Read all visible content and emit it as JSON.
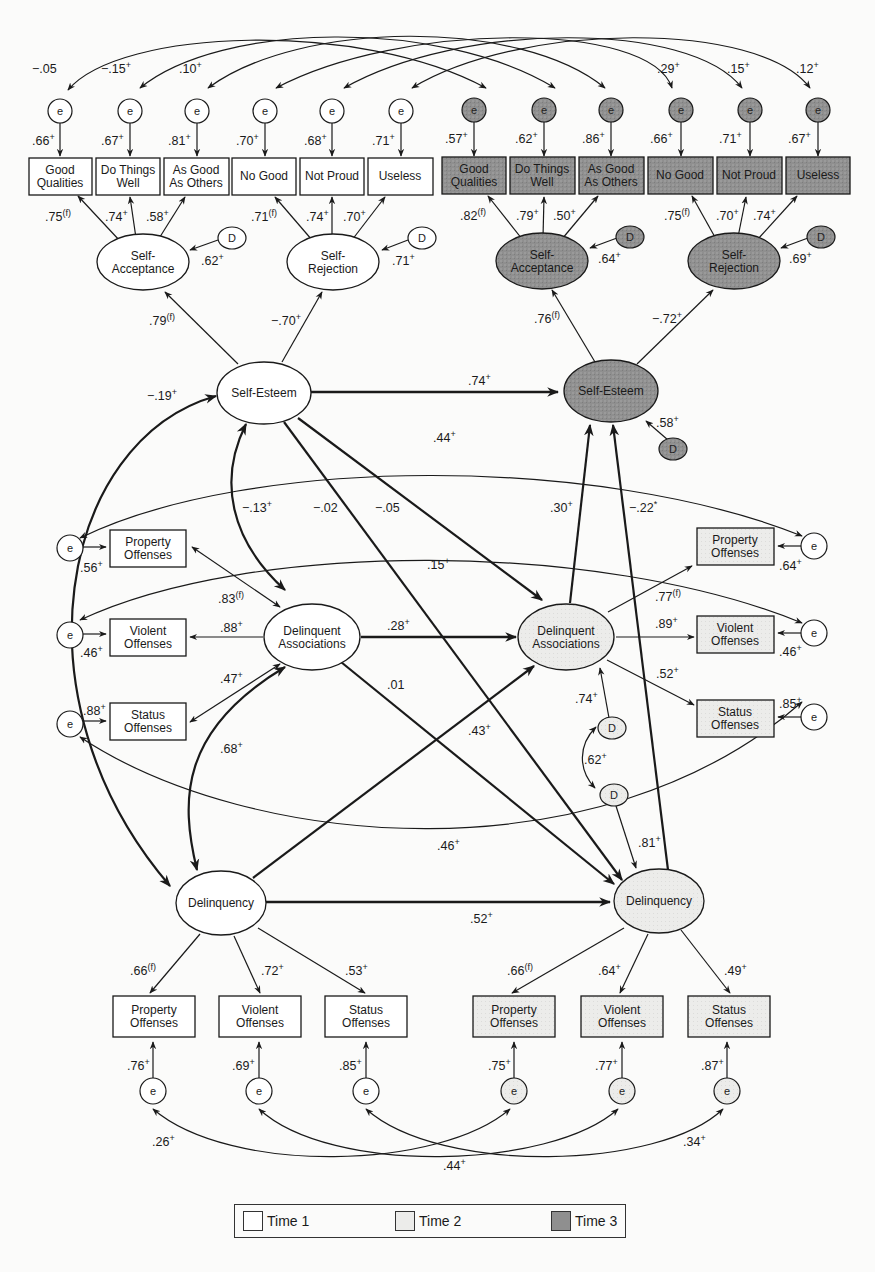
{
  "colors": {
    "time1": "#ffffff",
    "time2": "#ececea",
    "time3": "#8f8f8f",
    "stroke": "#1a1a1a"
  },
  "legend": [
    {
      "label": "Time 1",
      "key": "time1"
    },
    {
      "label": "Time 2",
      "key": "time2"
    },
    {
      "label": "Time 3",
      "key": "time3"
    }
  ],
  "error_label": "e",
  "disturbance_label": "D",
  "nodes": {
    "t1_good_qualities": {
      "lines": [
        "Good",
        "Qualities"
      ],
      "time": "time1"
    },
    "t1_do_things_well": {
      "lines": [
        "Do Things",
        "Well"
      ],
      "time": "time1"
    },
    "t1_as_good_as_others": {
      "lines": [
        "As Good",
        "As Others"
      ],
      "time": "time1"
    },
    "t1_no_good": {
      "lines": [
        "No Good"
      ],
      "time": "time1"
    },
    "t1_not_proud": {
      "lines": [
        "Not Proud"
      ],
      "time": "time1"
    },
    "t1_useless": {
      "lines": [
        "Useless"
      ],
      "time": "time1"
    },
    "t3_good_qualities": {
      "lines": [
        "Good",
        "Qualities"
      ],
      "time": "time3"
    },
    "t3_do_things_well": {
      "lines": [
        "Do Things",
        "Well"
      ],
      "time": "time3"
    },
    "t3_as_good_as_others": {
      "lines": [
        "As Good",
        "As Others"
      ],
      "time": "time3"
    },
    "t3_no_good": {
      "lines": [
        "No Good"
      ],
      "time": "time3"
    },
    "t3_not_proud": {
      "lines": [
        "Not Proud"
      ],
      "time": "time3"
    },
    "t3_useless": {
      "lines": [
        "Useless"
      ],
      "time": "time3"
    },
    "t1_self_acceptance": {
      "lines": [
        "Self-",
        "Acceptance"
      ],
      "time": "time1"
    },
    "t1_self_rejection": {
      "lines": [
        "Self-",
        "Rejection"
      ],
      "time": "time1"
    },
    "t3_self_acceptance": {
      "lines": [
        "Self-",
        "Acceptance"
      ],
      "time": "time3"
    },
    "t3_self_rejection": {
      "lines": [
        "Self-",
        "Rejection"
      ],
      "time": "time3"
    },
    "t1_self_esteem": {
      "lines": [
        "Self-Esteem"
      ],
      "time": "time1"
    },
    "t3_self_esteem": {
      "lines": [
        "Self-Esteem"
      ],
      "time": "time3"
    },
    "t1_property_offenses_da": {
      "lines": [
        "Property",
        "Offenses"
      ],
      "time": "time1"
    },
    "t1_violent_offenses_da": {
      "lines": [
        "Violent",
        "Offenses"
      ],
      "time": "time1"
    },
    "t1_status_offenses_da": {
      "lines": [
        "Status",
        "Offenses"
      ],
      "time": "time1"
    },
    "t1_delinquent_associations": {
      "lines": [
        "Delinquent",
        "Associations"
      ],
      "time": "time1"
    },
    "t2_delinquent_associations": {
      "lines": [
        "Delinquent",
        "Associations"
      ],
      "time": "time2"
    },
    "t2_property_offenses_da": {
      "lines": [
        "Property",
        "Offenses"
      ],
      "time": "time2"
    },
    "t2_violent_offenses_da": {
      "lines": [
        "Violent",
        "Offenses"
      ],
      "time": "time2"
    },
    "t2_status_offenses_da": {
      "lines": [
        "Status",
        "Offenses"
      ],
      "time": "time2"
    },
    "t1_delinquency": {
      "lines": [
        "Delinquency"
      ],
      "time": "time1"
    },
    "t2_delinquency": {
      "lines": [
        "Delinquency"
      ],
      "time": "time2"
    },
    "t1_property_offenses": {
      "lines": [
        "Property",
        "Offenses"
      ],
      "time": "time1"
    },
    "t1_violent_offenses": {
      "lines": [
        "Violent",
        "Offenses"
      ],
      "time": "time1"
    },
    "t1_status_offenses": {
      "lines": [
        "Status",
        "Offenses"
      ],
      "time": "time1"
    },
    "t2_property_offenses": {
      "lines": [
        "Property",
        "Offenses"
      ],
      "time": "time2"
    },
    "t2_violent_offenses": {
      "lines": [
        "Violent",
        "Offenses"
      ],
      "time": "time2"
    },
    "t2_status_offenses": {
      "lines": [
        "Status",
        "Offenses"
      ],
      "time": "time2"
    }
  },
  "coefficients": {
    "top_arcs": [
      {
        "value": "−.05",
        "sup": ""
      },
      {
        "value": "−.15",
        "sup": "+"
      },
      {
        "value": ".10",
        "sup": "+"
      },
      {
        "value": ".29",
        "sup": "+"
      },
      {
        "value": ".15",
        "sup": "+"
      },
      {
        "value": ".12",
        "sup": "+"
      }
    ],
    "t1_item_errors": [
      {
        "value": ".66",
        "sup": "+"
      },
      {
        "value": ".67",
        "sup": "+"
      },
      {
        "value": ".81",
        "sup": "+"
      },
      {
        "value": ".70",
        "sup": "+"
      },
      {
        "value": ".68",
        "sup": "+"
      },
      {
        "value": ".71",
        "sup": "+"
      }
    ],
    "t3_item_errors": [
      {
        "value": ".57",
        "sup": "+"
      },
      {
        "value": ".62",
        "sup": "+"
      },
      {
        "value": ".86",
        "sup": "+"
      },
      {
        "value": ".66",
        "sup": "+"
      },
      {
        "value": ".71",
        "sup": "+"
      },
      {
        "value": ".67",
        "sup": "+"
      }
    ],
    "t1_acceptance_loadings": [
      {
        "value": ".75",
        "sup": "(f)"
      },
      {
        "value": ".74",
        "sup": "+"
      },
      {
        "value": ".58",
        "sup": "+"
      }
    ],
    "t1_rejection_loadings": [
      {
        "value": ".71",
        "sup": "(f)"
      },
      {
        "value": ".74",
        "sup": "+"
      },
      {
        "value": ".70",
        "sup": "+"
      }
    ],
    "t3_acceptance_loadings": [
      {
        "value": ".82",
        "sup": "(f)"
      },
      {
        "value": ".79",
        "sup": "+"
      },
      {
        "value": ".50",
        "sup": "+"
      }
    ],
    "t3_rejection_loadings": [
      {
        "value": ".75",
        "sup": "(f)"
      },
      {
        "value": ".70",
        "sup": "+"
      },
      {
        "value": ".74",
        "sup": "+"
      }
    ],
    "t1_acceptance_D": {
      "value": ".62",
      "sup": "+"
    },
    "t1_rejection_D": {
      "value": ".71",
      "sup": "+"
    },
    "t3_acceptance_D": {
      "value": ".64",
      "sup": "+"
    },
    "t3_rejection_D": {
      "value": ".69",
      "sup": "+"
    },
    "t1_se_to_acceptance": {
      "value": ".79",
      "sup": "(f)"
    },
    "t1_se_to_rejection": {
      "value": "−.70",
      "sup": "+"
    },
    "t3_se_to_acceptance": {
      "value": ".76",
      "sup": "(f)"
    },
    "t3_se_to_rejection": {
      "value": "−.72",
      "sup": "+"
    },
    "se_t1_to_t3": {
      "value": ".74",
      "sup": "+"
    },
    "t3_se_D": {
      "value": ".58",
      "sup": "+"
    },
    "se_delinquency_cov": {
      "value": "−.19",
      "sup": "+"
    },
    "se_da_cov": {
      "value": "−.13",
      "sup": "+"
    },
    "se_t1_to_delinquency_t2": {
      "value": "−.02",
      "sup": ""
    },
    "se_t1_to_da_t2": {
      "value": "−.05",
      "sup": ""
    },
    "property_da_cross": {
      "value": ".44",
      "sup": "+"
    },
    "violent_da_cross": {
      "value": ".15",
      "sup": "+"
    },
    "status_da_cross": {
      "value": ".46",
      "sup": "+"
    },
    "da_t2_to_se_t3": {
      "value": ".30",
      "sup": "+"
    },
    "delinquency_t2_to_se_t3": {
      "value": "−.22",
      "sup": "*"
    },
    "t1_da_property_err": {
      "value": ".56",
      "sup": "+"
    },
    "t1_da_violent_err": {
      "value": ".46",
      "sup": "+"
    },
    "t1_da_status_err": {
      "value": ".88",
      "sup": "+"
    },
    "t1_da_property_load": {
      "value": ".83",
      "sup": "(f)"
    },
    "t1_da_violent_load": {
      "value": ".88",
      "sup": "+"
    },
    "t1_da_status_load": {
      "value": ".47",
      "sup": "+"
    },
    "da_t1_to_t2": {
      "value": ".28",
      "sup": "+"
    },
    "da_t1_to_delinquency_t2": {
      "value": ".01",
      "sup": ""
    },
    "delinquency_t1_to_da_t2": {
      "value": ".43",
      "sup": "+"
    },
    "da_delinquency_cov": {
      "value": ".68",
      "sup": "+"
    },
    "t2_da_property_load": {
      "value": ".77",
      "sup": "(f)"
    },
    "t2_da_violent_load": {
      "value": ".89",
      "sup": "+"
    },
    "t2_da_status_load": {
      "value": ".52",
      "sup": "+"
    },
    "t2_da_property_err": {
      "value": ".64",
      "sup": "+"
    },
    "t2_da_violent_err": {
      "value": ".46",
      "sup": "+"
    },
    "t2_da_status_err": {
      "value": ".85",
      "sup": "+"
    },
    "t2_da_D": {
      "value": ".74",
      "sup": "+"
    },
    "t2_D_cov": {
      "value": ".62",
      "sup": "+"
    },
    "t2_delinquency_D": {
      "value": ".81",
      "sup": "+"
    },
    "delinquency_t1_to_t2": {
      "value": ".52",
      "sup": "+"
    },
    "t1_del_loadings": [
      {
        "value": ".66",
        "sup": "(f)"
      },
      {
        "value": ".72",
        "sup": "+"
      },
      {
        "value": ".53",
        "sup": "+"
      }
    ],
    "t2_del_loadings": [
      {
        "value": ".66",
        "sup": "(f)"
      },
      {
        "value": ".64",
        "sup": "+"
      },
      {
        "value": ".49",
        "sup": "+"
      }
    ],
    "t1_del_errors": [
      {
        "value": ".76",
        "sup": "+"
      },
      {
        "value": ".69",
        "sup": "+"
      },
      {
        "value": ".85",
        "sup": "+"
      }
    ],
    "t2_del_errors": [
      {
        "value": ".75",
        "sup": "+"
      },
      {
        "value": ".77",
        "sup": "+"
      },
      {
        "value": ".87",
        "sup": "+"
      }
    ],
    "bottom_arcs": [
      {
        "value": ".26",
        "sup": "+"
      },
      {
        "value": ".44",
        "sup": "+"
      },
      {
        "value": ".34",
        "sup": "+"
      }
    ]
  }
}
